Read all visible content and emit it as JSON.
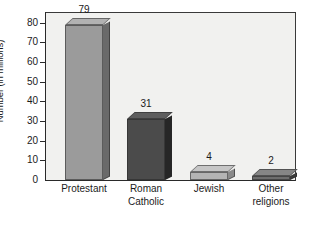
{
  "chart_data": {
    "type": "bar",
    "title": "",
    "subtitle": "",
    "xlabel": "",
    "ylabel": "Number (in millions)",
    "categories": [
      "Protestant",
      "Roman Catholic",
      "Jewish",
      "Other religions"
    ],
    "values": [
      79,
      31,
      4,
      2
    ],
    "value_labels": [
      "79",
      "31",
      "4",
      "2"
    ],
    "ylim": [
      0,
      85
    ],
    "yticks": [
      0,
      10,
      20,
      30,
      40,
      50,
      60,
      70,
      80
    ],
    "ytick_labels": [
      "0",
      "10",
      "20",
      "30",
      "40",
      "50",
      "60",
      "70",
      "80"
    ],
    "grid": false,
    "legend": false,
    "style": "3d-bars",
    "series": [
      {
        "name": "Number of adherents",
        "values": [
          79,
          31,
          4,
          2
        ]
      }
    ],
    "bar_colors": [
      "#9b9b9b",
      "#4b4b4b",
      "#b4b4b4",
      "#6e6e6e"
    ],
    "bar_side_colors": [
      "#6a6a6a",
      "#262626",
      "#8a8a8a",
      "#3a3a3a"
    ],
    "bar_top_colors": [
      "#b2b2b2",
      "#5e5e5e",
      "#c6c6c6",
      "#868686"
    ],
    "plot_background": "#f1f1ef",
    "page_background": "#ffffff",
    "axis_color": "#2a2a2a",
    "text_color": "#1b1b1b"
  },
  "axes": {
    "y_title": "Number (in millions)",
    "ticks": [
      {
        "label": "80",
        "value": 80
      },
      {
        "label": "70",
        "value": 70
      },
      {
        "label": "60",
        "value": 60
      },
      {
        "label": "50",
        "value": 50
      },
      {
        "label": "40",
        "value": 40
      },
      {
        "label": "30",
        "value": 30
      },
      {
        "label": "20",
        "value": 20
      },
      {
        "label": "10",
        "value": 10
      },
      {
        "label": "0",
        "value": 0
      }
    ]
  },
  "categories": [
    {
      "line1": "Protestant",
      "line2": ""
    },
    {
      "line1": "Roman",
      "line2": "Catholic"
    },
    {
      "line1": "Jewish",
      "line2": ""
    },
    {
      "line1": "Other",
      "line2": "religions"
    }
  ]
}
